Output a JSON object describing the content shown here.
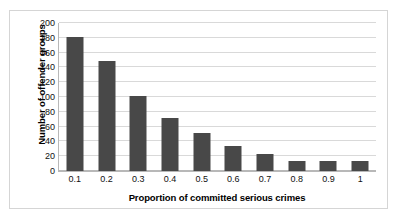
{
  "chart_data": {
    "type": "bar",
    "title": "",
    "xlabel": "Proportion of committed serious crimes",
    "ylabel": "Number of offender groups",
    "categories": [
      "0.1",
      "0.2",
      "0.3",
      "0.4",
      "0.5",
      "0.6",
      "0.7",
      "0.8",
      "0.9",
      "1"
    ],
    "values": [
      181,
      148,
      101,
      71,
      52,
      34,
      23,
      14,
      13,
      13
    ],
    "ylim": [
      0,
      200
    ],
    "ytick_labels": [
      "200",
      "180",
      "160",
      "140",
      "120",
      "100",
      "80",
      "60",
      "40",
      "20",
      "0"
    ],
    "ytick_values": [
      200,
      180,
      160,
      140,
      120,
      100,
      80,
      60,
      40,
      20,
      0
    ],
    "grid": true,
    "legend": "none",
    "bar_color": "#484848",
    "gridline_color": "#d9d9d9",
    "axis_color": "#b8b8b8",
    "background_color": "#ffffff",
    "border_color": "#d5d5d5"
  }
}
